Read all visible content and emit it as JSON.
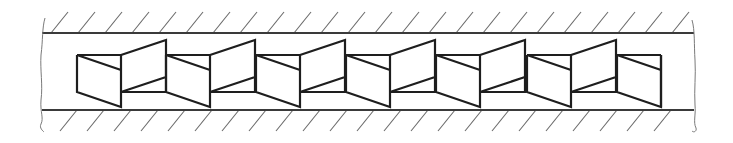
{
  "diagram": {
    "colors": {
      "background": "#ffffff",
      "line": "#1e1e1e",
      "wall": "#3a3a3a",
      "hatch": "#6a6a6a"
    },
    "channel": {
      "top_wall_y": 33,
      "bottom_wall_y": 110,
      "left_x": 42,
      "right_x": 694
    },
    "hatch": {
      "top_start_x": 51,
      "bottom_start_x": 77,
      "spacing": 27,
      "dx": 17,
      "dy": 21
    },
    "elements": {
      "origin_x": [
        77,
        166,
        256,
        346,
        436,
        527,
        617
      ],
      "box_width": 44,
      "panel_width": 45,
      "box_top_y": 55,
      "box_bottom_y": 92,
      "box_low_y": 107,
      "panel_top_y": 40,
      "panel_diag_y": 77,
      "last_partial": true
    },
    "labels": []
  }
}
